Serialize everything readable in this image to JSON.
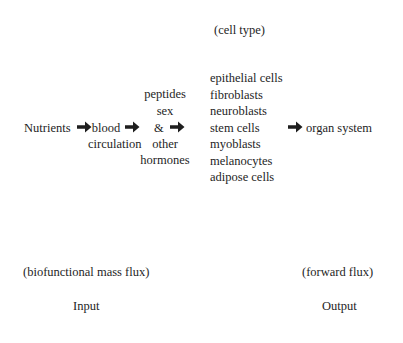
{
  "header": {
    "cell_type_label": "(cell type)"
  },
  "flow": {
    "nutrients": "Nutrients",
    "blood": "blood",
    "circulation": "circulation",
    "hormones": {
      "line1": "peptides",
      "line2": "sex",
      "line3": "&",
      "line4": "other",
      "line5": "hormones"
    },
    "cell_types": [
      "epithelial cells",
      "fibroblasts",
      "neuroblasts",
      "stem cells",
      "myoblasts",
      "melanocytes",
      "adipose cells"
    ],
    "output": "organ system",
    "arrow_icon": "heavy-right-arrow"
  },
  "footer": {
    "input_caption": "(biofunctional mass flux)",
    "input_label": "Input",
    "output_caption": "(forward flux)",
    "output_label": "Output"
  },
  "colors": {
    "text": "#1e1e1e",
    "background": "#ffffff"
  }
}
